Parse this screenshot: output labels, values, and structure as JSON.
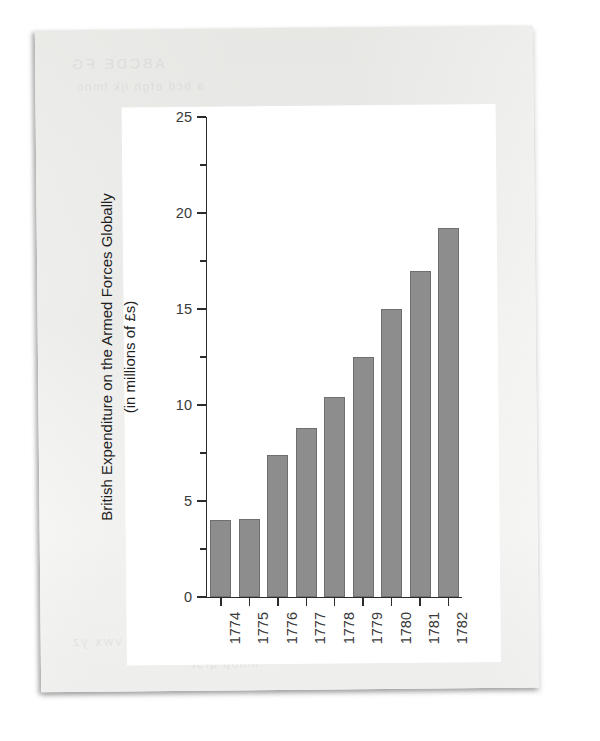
{
  "figure": {
    "kind": "scanned-book-page-bar-chart"
  },
  "chart_data": {
    "type": "bar",
    "title": "",
    "xlabel": "",
    "ylabel": "British Expenditure on the Armed Forces Globally\n(in millions of £s)",
    "ylabel_line1": "British Expenditure on the Armed Forces Globally",
    "ylabel_line2": "(in millions of £s)",
    "categories": [
      "1774",
      "1775",
      "1776",
      "1777",
      "1778",
      "1779",
      "1780",
      "1781",
      "1782"
    ],
    "values": [
      4.0,
      4.05,
      7.4,
      8.8,
      10.4,
      12.5,
      15.0,
      17.0,
      19.2
    ],
    "ylim": [
      0,
      25
    ],
    "y_major_ticks": [
      0,
      5,
      10,
      15,
      20,
      25
    ],
    "y_minor_ticks": [
      2.5,
      7.5,
      12.5,
      17.5,
      22.5
    ],
    "y_tick_labels": [
      "0",
      "5",
      "10",
      "15",
      "20",
      "25"
    ],
    "grid": false,
    "legend": false,
    "bar_color": "#8d8d8d",
    "bar_edge_color": "#6f6f6f",
    "axis_color": "#2b2b2b",
    "panel_color": "#ffffff",
    "page_color": "#fbfbfa"
  },
  "bleed_text": {
    "line1": "ABCDE FG",
    "line2": "a bcd efgh ijk lmno",
    "line3": "qrstu vwx yz",
    "line4": "mnop qrst"
  }
}
